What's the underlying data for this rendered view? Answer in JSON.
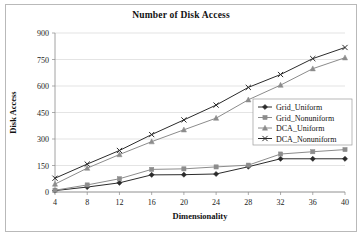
{
  "chart_data": {
    "type": "line",
    "title": "Number of Disk Access",
    "xlabel": "Dimensionality",
    "ylabel": "Disk Access",
    "x": [
      4,
      8,
      12,
      16,
      20,
      24,
      28,
      32,
      36,
      40
    ],
    "xticklabels": [
      "4",
      "8",
      "12",
      "16",
      "20",
      "24",
      "28",
      "32",
      "36",
      "40"
    ],
    "yticklabels": [
      "0",
      "150",
      "300",
      "450",
      "600",
      "750",
      "900"
    ],
    "yticks": [
      0,
      150,
      300,
      450,
      600,
      750,
      900
    ],
    "ylim": [
      0,
      900
    ],
    "xlim": [
      4,
      40
    ],
    "grid": "horizontal",
    "legend_position": "center-right",
    "series": [
      {
        "name": "Grid_Uniform",
        "marker": "diamond",
        "color": "#2b2b2b",
        "values": [
          8,
          28,
          52,
          97,
          98,
          102,
          143,
          188,
          188,
          188
        ]
      },
      {
        "name": "Grid_Nonuniform",
        "marker": "square",
        "color": "#8c8c8c",
        "values": [
          10,
          40,
          75,
          128,
          131,
          142,
          152,
          215,
          228,
          240
        ]
      },
      {
        "name": "DCA_Uniform",
        "marker": "triangle",
        "color": "#8c8c8c",
        "values": [
          45,
          135,
          212,
          285,
          352,
          418,
          522,
          605,
          698,
          760
        ]
      },
      {
        "name": "DCA_Nonuniform",
        "marker": "cross",
        "color": "#2b2b2b",
        "values": [
          78,
          158,
          235,
          325,
          408,
          492,
          592,
          665,
          755,
          818
        ]
      }
    ]
  }
}
